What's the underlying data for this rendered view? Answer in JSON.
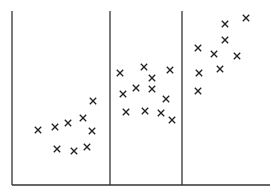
{
  "chart_data": {
    "type": "scatter",
    "title": "",
    "xlabel": "",
    "ylabel": "",
    "grid": false,
    "marker": "x",
    "colors": {
      "axis": "#333333",
      "marker": "#222222",
      "background": "#ffffff"
    },
    "panels": [
      {
        "name": "segment-1",
        "x_range_px": [
          12,
          110
        ],
        "points_px": [
          [
            38,
            130
          ],
          [
            55,
            127
          ],
          [
            68,
            123
          ],
          [
            83,
            118
          ],
          [
            93,
            101
          ],
          [
            92,
            131
          ],
          [
            57,
            149
          ],
          [
            74,
            151
          ],
          [
            87,
            147
          ]
        ]
      },
      {
        "name": "segment-2",
        "x_range_px": [
          110,
          182
        ],
        "points_px": [
          [
            120,
            73
          ],
          [
            144,
            67
          ],
          [
            170,
            70
          ],
          [
            152,
            78
          ],
          [
            123,
            94
          ],
          [
            136,
            88
          ],
          [
            152,
            89
          ],
          [
            166,
            99
          ],
          [
            126,
            112
          ],
          [
            145,
            111
          ],
          [
            161,
            113
          ],
          [
            172,
            120
          ]
        ]
      },
      {
        "name": "segment-3",
        "x_range_px": [
          182,
          270
        ],
        "points_px": [
          [
            198,
            48
          ],
          [
            214,
            54
          ],
          [
            225,
            40
          ],
          [
            246,
            18
          ],
          [
            237,
            56
          ],
          [
            225,
            24
          ],
          [
            199,
            73
          ],
          [
            220,
            69
          ],
          [
            198,
            91
          ]
        ]
      }
    ],
    "axes": {
      "baseline_y_px": 185,
      "baseline_x_range_px": [
        12,
        270
      ],
      "dividers_x_px": [
        12,
        110,
        182
      ],
      "dividers_top_y_px": 11
    }
  }
}
